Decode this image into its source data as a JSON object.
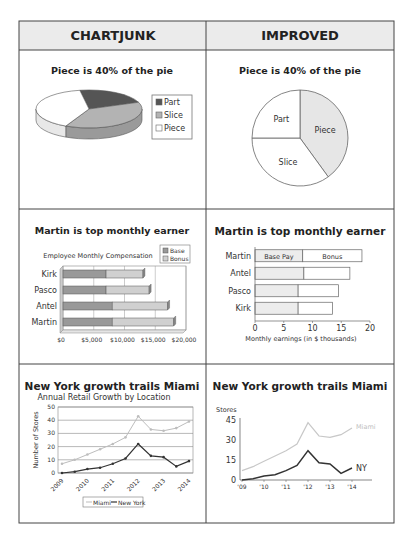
{
  "table": {
    "headers": [
      "CHARTJUNK",
      "IMPROVED"
    ]
  },
  "chart_data": [
    {
      "id": "pie-chartjunk",
      "type": "pie",
      "style": "3d",
      "title": "Piece is 40% of the pie",
      "categories": [
        "Part",
        "Slice",
        "Piece"
      ],
      "values": [
        22,
        38,
        40
      ],
      "colors": [
        "#555555",
        "#b3b3b3",
        "#ffffff"
      ],
      "legend": [
        "Part",
        "Slice",
        "Piece"
      ],
      "legend_position": "right"
    },
    {
      "id": "pie-improved",
      "type": "pie",
      "title": "Piece is 40% of the pie",
      "categories": [
        "Piece",
        "Slice",
        "Part"
      ],
      "values": [
        40,
        35,
        25
      ],
      "colors": [
        "#e6e6e6",
        "#ffffff",
        "#ffffff"
      ],
      "slice_labels": [
        "Piece",
        "Slice",
        "Part"
      ]
    },
    {
      "id": "bar-chartjunk",
      "type": "bar",
      "orientation": "horizontal",
      "stacked": true,
      "style": "3d",
      "title": "Martin is top monthly earner",
      "subtitle": "Employee Monthly Compensation",
      "categories": [
        "Kirk",
        "Pasco",
        "Antel",
        "Martin"
      ],
      "series": [
        {
          "name": "Base",
          "values": [
            7000,
            7000,
            8000,
            8000
          ]
        },
        {
          "name": "Bonus",
          "values": [
            6000,
            7000,
            9000,
            10000
          ]
        }
      ],
      "xlim": [
        0,
        20000
      ],
      "xticks": [
        "$0",
        "$5,000",
        "$10,000",
        "$15,000",
        "$20,000"
      ],
      "xtick_values": [
        0,
        5000,
        10000,
        15000,
        20000
      ],
      "legend": [
        "Base",
        "Bonus"
      ],
      "legend_position": "top-right",
      "grid": true
    },
    {
      "id": "bar-improved",
      "type": "bar",
      "orientation": "horizontal",
      "stacked": true,
      "title": "Martin is top monthly earner",
      "categories": [
        "Martin",
        "Antel",
        "Pasco",
        "Kirk"
      ],
      "series": [
        {
          "name": "Base Pay",
          "values": [
            8.3,
            8.5,
            7.5,
            7.5
          ]
        },
        {
          "name": "Bonus",
          "values": [
            10.3,
            8.0,
            7.0,
            6.0
          ]
        }
      ],
      "inline_labels": [
        "Base Pay",
        "Bonus"
      ],
      "xlim": [
        0,
        20
      ],
      "xticks": [
        "0",
        "5",
        "10",
        "15",
        "20"
      ],
      "xtick_values": [
        0,
        5,
        10,
        15,
        20
      ],
      "xlabel": "Monthly earnings (in $ thousands)",
      "grid": false
    },
    {
      "id": "line-chartjunk",
      "type": "line",
      "title": "New York growth trails Miami",
      "subtitle": "Annual Retail Growth by Location",
      "ylabel": "Number of Stores",
      "ylim": [
        0,
        50
      ],
      "yticks": [
        "0",
        "10",
        "20",
        "30",
        "40",
        "50"
      ],
      "ytick_values": [
        0,
        10,
        20,
        30,
        40,
        50
      ],
      "x": [
        2009,
        2009.5,
        2010,
        2010.5,
        2011,
        2011.5,
        2012,
        2012.5,
        2013,
        2013.5,
        2014
      ],
      "xticks": [
        "2009",
        "2010",
        "2011",
        "2012",
        "2013",
        "2014"
      ],
      "xtick_values": [
        2009,
        2010,
        2011,
        2012,
        2013,
        2014
      ],
      "series": [
        {
          "name": "Miami",
          "color": "#bdbdbd",
          "values": [
            7,
            10,
            14,
            18,
            22,
            27,
            43,
            33,
            32,
            34,
            39
          ]
        },
        {
          "name": "New York",
          "color": "#333333",
          "values": [
            0,
            1,
            3,
            4,
            7,
            11,
            22,
            13,
            12,
            5,
            9
          ]
        }
      ],
      "legend": [
        "Miami",
        "New York"
      ],
      "legend_position": "bottom",
      "grid": true
    },
    {
      "id": "line-improved",
      "type": "line",
      "title": "New York growth trails Miami",
      "ylabel": "Stores",
      "ylim": [
        0,
        45
      ],
      "yticks": [
        "0",
        "15",
        "30",
        "45"
      ],
      "ytick_values": [
        0,
        15,
        30,
        45
      ],
      "x": [
        2009,
        2009.5,
        2010,
        2010.5,
        2011,
        2011.5,
        2012,
        2012.5,
        2013,
        2013.5,
        2014
      ],
      "xticks": [
        "'09",
        "'10",
        "'11",
        "'12",
        "'13",
        "'14"
      ],
      "xtick_values": [
        2009,
        2010,
        2011,
        2012,
        2013,
        2014
      ],
      "series": [
        {
          "name": "Miami",
          "color": "#c8c8c8",
          "values": [
            7,
            10,
            14,
            18,
            22,
            27,
            43,
            33,
            32,
            34,
            39
          ]
        },
        {
          "name": "NY",
          "color": "#333333",
          "values": [
            0,
            1,
            3,
            4,
            7,
            11,
            22,
            13,
            12,
            5,
            9
          ]
        }
      ],
      "direct_labels": [
        "Miami",
        "NY"
      ],
      "grid": false
    }
  ]
}
